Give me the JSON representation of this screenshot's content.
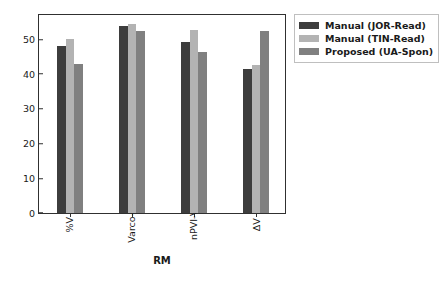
{
  "chart_data": {
    "type": "bar",
    "title": "",
    "subtitle": "",
    "xlabel": "RM",
    "ylabel": "",
    "categories": [
      "%V",
      "Varco-V",
      "nPVI-V",
      "ΔV"
    ],
    "series": [
      {
        "name": "Manual (JOR-Read)",
        "color": "#3d3d3d",
        "values": [
          48.2,
          53.9,
          49.2,
          41.5
        ]
      },
      {
        "name": "Manual (TIN-Read)",
        "color": "#b3b3b3",
        "values": [
          50.0,
          54.5,
          52.7,
          42.5
        ]
      },
      {
        "name": "Proposed (UA-Spon)",
        "color": "#808080",
        "values": [
          43.0,
          52.3,
          46.4,
          52.3
        ]
      }
    ],
    "ylim": [
      0,
      57
    ],
    "yticks": [
      0,
      10,
      20,
      30,
      40,
      50
    ],
    "ytick_labels": [
      "0",
      "10",
      "20",
      "30",
      "40",
      "50"
    ],
    "grid": false,
    "legend_position": "upper right",
    "legend_entries": [
      "Manual (JOR-Read)",
      "Manual (TIN-Read)",
      "Proposed (UA-Spon)"
    ],
    "background_color": "#ffffff",
    "axis_color": "#303030"
  }
}
